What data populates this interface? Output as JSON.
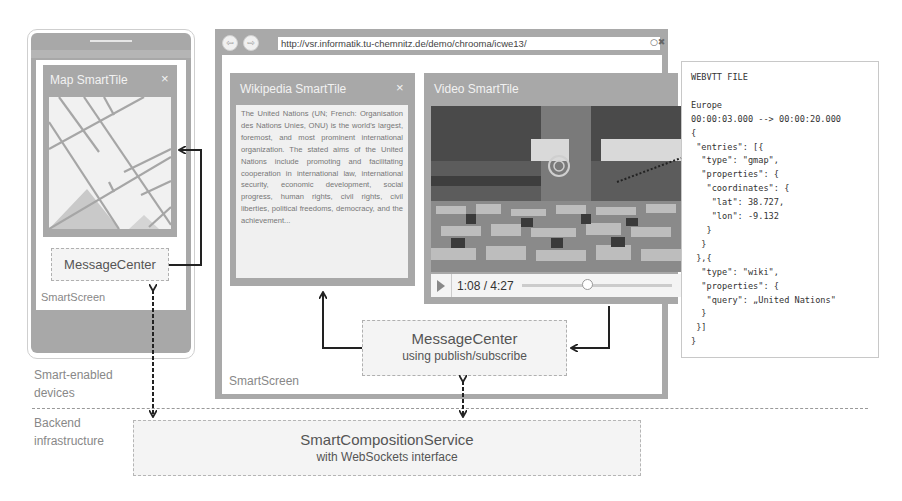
{
  "phone": {
    "map_tile": {
      "title": "Map SmartTile",
      "close_icon": "×"
    },
    "message_center": "MessageCenter",
    "screen_label": "SmartScreen"
  },
  "browser": {
    "back_icon": "⇦",
    "forward_icon": "⇨",
    "url": "http://vsr.informatik.tu-chemnitz.de/demo/chrooma/icwe13/",
    "reload_icon": "○✖",
    "wiki_tile": {
      "title": "Wikipedia SmartTile",
      "close_icon": "×",
      "text": "The United Nations (UN; French: Organisation des Nations Unies, ONU) is the world's largest, foremost, and most prominent international organization. The stated aims of the United Nations include promoting and facilitating cooperation in international law, international security, economic development, social progress, human rights, civil rights, civil liberties, political freedoms, democracy, and the achievement..."
    },
    "video_tile": {
      "title": "Video SmartTile",
      "time": "1:08 / 4:27",
      "progress_percent": 25
    },
    "message_center": {
      "title": "MessageCenter",
      "subtitle": "using publish/subscribe"
    },
    "screen_label": "SmartScreen"
  },
  "webvtt": {
    "content": "WEBVTT FILE\n\nEurope\n00:00:03.000 --> 00:00:20.000\n{\n \"entries\": [{\n  \"type\": \"gmap\",\n  \"properties\": {\n   \"coordinates\": {\n    \"lat\": 38.727,\n    \"lon\": -9.132\n   }\n  }\n },{\n  \"type\": \"wiki\",\n  \"properties\": {\n   \"query\": „United Nations\"\n  }\n }]\n}"
  },
  "layers": {
    "devices": "Smart-enabled\ndevices",
    "devices_line1": "Smart-enabled",
    "devices_line2": "devices",
    "backend_line1": "Backend",
    "backend_line2": "infrastructure"
  },
  "backend": {
    "title": "SmartCompositionService",
    "subtitle": "with WebSockets interface"
  }
}
